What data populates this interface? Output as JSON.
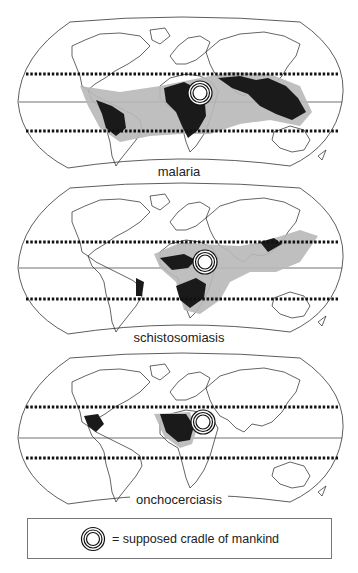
{
  "maps": [
    {
      "id": "malaria",
      "label": "malaria"
    },
    {
      "id": "schistosomiasis",
      "label": "schistosomiasis"
    },
    {
      "id": "onchocerciasis",
      "label": "onchocerciasis"
    }
  ],
  "legend": {
    "symbol": "concentric-circles-icon",
    "text": "= supposed cradle of mankind"
  },
  "colors": {
    "outline": "#222222",
    "endemic_high": "#1a1a1a",
    "endemic_area": "#b8b8b8",
    "tropic_line": "#111111"
  }
}
